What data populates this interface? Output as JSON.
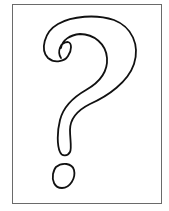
{
  "figure": {
    "label": "Question mark",
    "icon": "question-mark-icon",
    "stroke_color": "#111111",
    "frame_color": "#6a6a6a",
    "background": "#ffffff"
  }
}
